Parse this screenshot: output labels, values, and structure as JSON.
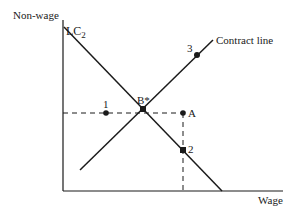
{
  "diagram": {
    "type": "labor-contract-diagram",
    "axes": {
      "y_label": "Non-wage",
      "x_label": "Wage"
    },
    "curves": {
      "isocost": {
        "label_main": "LC",
        "label_sub": "2"
      },
      "contract": {
        "label": "Contract line"
      }
    },
    "points": {
      "p1": {
        "label": "1"
      },
      "bstar": {
        "label": "B*"
      },
      "pA": {
        "label": "A"
      },
      "p2": {
        "label": "2"
      },
      "p3": {
        "label": "3"
      }
    },
    "colors": {
      "ink": "#1a1a1a",
      "background": "#ffffff"
    }
  }
}
